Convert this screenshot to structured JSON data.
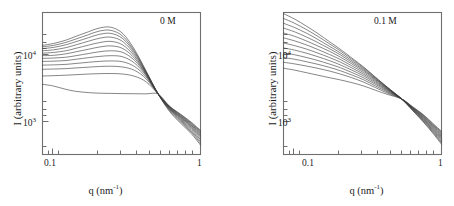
{
  "figure": {
    "type": "scientific-figure",
    "panel_count": 2
  },
  "axes": {
    "xlabel_text": "q (nm",
    "xlabel_sup": "-1",
    "xlabel_tail": ")",
    "ylabel": "I (arbitrary units)",
    "xticks": [
      "0.1",
      "1"
    ],
    "yticks": [
      "10",
      "10"
    ],
    "ytick_exponents": [
      "4",
      "3"
    ],
    "xscale": "log",
    "yscale": "log",
    "xlim": [
      0.075,
      1.0
    ],
    "ylim": [
      550,
      32000
    ]
  },
  "panels": [
    {
      "id": "panel-0M",
      "tag": "0 M",
      "tag_label": "0 M",
      "curve_count": 12
    },
    {
      "id": "panel-0.1M",
      "tag": "0.1 M",
      "tag_label": "0.1 M",
      "curve_count": 12
    }
  ],
  "chart_data": [
    {
      "type": "line",
      "title": "0 M",
      "xlabel": "q (nm^-1)",
      "ylabel": "I (arbitrary units)",
      "xscale": "log",
      "yscale": "log",
      "xlim": [
        0.075,
        1.0
      ],
      "ylim": [
        550,
        32000
      ],
      "xticks": [
        0.1,
        1
      ],
      "yticks": [
        1000,
        10000
      ],
      "grid": false,
      "legend": "none",
      "annotation": "0 M",
      "isosbestic_point": {
        "q": 0.5,
        "I": 3100
      },
      "x": [
        0.075,
        0.09,
        0.11,
        0.13,
        0.16,
        0.19,
        0.23,
        0.28,
        0.34,
        0.41,
        0.5,
        0.6,
        0.72,
        0.86,
        1.0
      ],
      "series": [
        {
          "name": "curve-1",
          "values": [
            12500,
            13200,
            14500,
            16200,
            18500,
            20500,
            21000,
            17500,
            11000,
            6000,
            3100,
            1900,
            1350,
            1000,
            720
          ]
        },
        {
          "name": "curve-2",
          "values": [
            12000,
            12500,
            13600,
            15000,
            17000,
            18800,
            19200,
            16200,
            10500,
            5900,
            3100,
            1950,
            1400,
            1040,
            760
          ]
        },
        {
          "name": "curve-3",
          "values": [
            11400,
            11800,
            12700,
            13900,
            15600,
            17100,
            17600,
            15100,
            10100,
            5800,
            3100,
            2000,
            1450,
            1080,
            800
          ]
        },
        {
          "name": "curve-4",
          "values": [
            10700,
            11000,
            11700,
            12700,
            14100,
            15300,
            15800,
            13900,
            9600,
            5700,
            3100,
            2030,
            1490,
            1120,
            840
          ]
        },
        {
          "name": "curve-5",
          "values": [
            10000,
            10200,
            10700,
            11500,
            12600,
            13500,
            14000,
            12600,
            9100,
            5600,
            3100,
            2060,
            1530,
            1160,
            880
          ]
        },
        {
          "name": "curve-6",
          "values": [
            9300,
            9400,
            9800,
            10400,
            11200,
            11900,
            12300,
            11400,
            8600,
            5500,
            3100,
            2090,
            1570,
            1200,
            915
          ]
        },
        {
          "name": "curve-7",
          "values": [
            8600,
            8700,
            8900,
            9300,
            9900,
            10400,
            10700,
            10200,
            8100,
            5400,
            3100,
            2110,
            1600,
            1235,
            950
          ]
        },
        {
          "name": "curve-8",
          "values": [
            7900,
            7950,
            8100,
            8400,
            8800,
            9100,
            9300,
            9000,
            7500,
            5250,
            3100,
            2130,
            1630,
            1265,
            980
          ]
        },
        {
          "name": "curve-9",
          "values": [
            7100,
            7150,
            7250,
            7450,
            7700,
            7900,
            8000,
            7800,
            6800,
            5050,
            3100,
            2150,
            1660,
            1295,
            1010
          ]
        },
        {
          "name": "curve-10",
          "values": [
            6300,
            6350,
            6420,
            6550,
            6700,
            6820,
            6880,
            6720,
            6100,
            4800,
            3100,
            2170,
            1690,
            1325,
            1040
          ]
        },
        {
          "name": "curve-11",
          "values": [
            5200,
            5250,
            5320,
            5400,
            5500,
            5560,
            5580,
            5500,
            5150,
            4400,
            3100,
            2190,
            1720,
            1355,
            1070
          ]
        },
        {
          "name": "curve-12",
          "values": [
            4100,
            3900,
            3550,
            3350,
            3230,
            3180,
            3160,
            3140,
            3130,
            3120,
            3100,
            2200,
            1750,
            1385,
            1100
          ]
        }
      ]
    },
    {
      "type": "line",
      "title": "0.1 M",
      "xlabel": "q (nm^-1)",
      "ylabel": "I (arbitrary units)",
      "xscale": "log",
      "yscale": "log",
      "xlim": [
        0.075,
        1.0
      ],
      "ylim": [
        550,
        32000
      ],
      "xticks": [
        0.1,
        1
      ],
      "yticks": [
        1000,
        10000
      ],
      "grid": false,
      "legend": "none",
      "annotation": "0.1 M",
      "isosbestic_point": {
        "q": 0.52,
        "I": 2700
      },
      "x": [
        0.075,
        0.09,
        0.11,
        0.13,
        0.16,
        0.19,
        0.23,
        0.28,
        0.34,
        0.41,
        0.52,
        0.62,
        0.74,
        0.86,
        1.0
      ],
      "series": [
        {
          "name": "curve-1",
          "values": [
            31000,
            26500,
            21500,
            17800,
            13800,
            11200,
            8700,
            6700,
            5000,
            3800,
            2700,
            1950,
            1400,
            1030,
            740
          ]
        },
        {
          "name": "curve-2",
          "values": [
            27000,
            23500,
            19500,
            16400,
            13000,
            10700,
            8400,
            6550,
            4950,
            3780,
            2700,
            1970,
            1430,
            1060,
            770
          ]
        },
        {
          "name": "curve-3",
          "values": [
            23500,
            20800,
            17600,
            15000,
            12100,
            10100,
            8050,
            6350,
            4850,
            3740,
            2700,
            1990,
            1460,
            1090,
            800
          ]
        },
        {
          "name": "curve-4",
          "values": [
            20500,
            18400,
            15800,
            13700,
            11300,
            9550,
            7700,
            6150,
            4750,
            3700,
            2700,
            2010,
            1490,
            1120,
            830
          ]
        },
        {
          "name": "curve-5",
          "values": [
            17800,
            16200,
            14100,
            12400,
            10500,
            8950,
            7350,
            5950,
            4650,
            3650,
            2700,
            2030,
            1520,
            1150,
            860
          ]
        },
        {
          "name": "curve-6",
          "values": [
            15500,
            14200,
            12600,
            11200,
            9600,
            8350,
            6950,
            5700,
            4520,
            3600,
            2700,
            2050,
            1550,
            1180,
            890
          ]
        },
        {
          "name": "curve-7",
          "values": [
            13400,
            12400,
            11200,
            10100,
            8800,
            7750,
            6550,
            5450,
            4380,
            3540,
            2700,
            2070,
            1580,
            1210,
            920
          ]
        },
        {
          "name": "curve-8",
          "values": [
            11600,
            10900,
            9950,
            9100,
            8050,
            7150,
            6150,
            5200,
            4230,
            3470,
            2700,
            2090,
            1610,
            1240,
            950
          ]
        },
        {
          "name": "curve-9",
          "values": [
            10100,
            9550,
            8800,
            8150,
            7300,
            6600,
            5750,
            4920,
            4080,
            3390,
            2700,
            2110,
            1640,
            1270,
            980
          ]
        },
        {
          "name": "curve-10",
          "values": [
            8800,
            8400,
            7800,
            7300,
            6650,
            6050,
            5350,
            4650,
            3900,
            3300,
            2700,
            2130,
            1670,
            1300,
            1010
          ]
        },
        {
          "name": "curve-11",
          "values": [
            7700,
            7350,
            6900,
            6500,
            5980,
            5500,
            4950,
            4350,
            3720,
            3200,
            2700,
            2150,
            1700,
            1330,
            1040
          ]
        },
        {
          "name": "curve-12",
          "values": [
            6500,
            6150,
            5700,
            5350,
            4950,
            4650,
            4300,
            3900,
            3450,
            3080,
            2700,
            2170,
            1730,
            1360,
            1070
          ]
        }
      ]
    }
  ]
}
